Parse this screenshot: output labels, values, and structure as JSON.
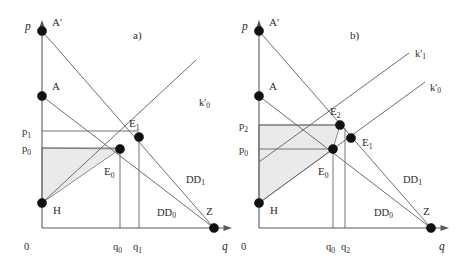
{
  "figure": {
    "panels": [
      {
        "id": "a",
        "label": "a)",
        "axes": {
          "y_label": "p",
          "x_label": "q",
          "origin_label": "0"
        },
        "price_ticks": [
          {
            "name": "p1",
            "label": "p",
            "sub": "1",
            "value_y": 131
          },
          {
            "name": "p0",
            "label": "p",
            "sub": "0",
            "value_y": 148
          }
        ],
        "quantity_ticks": [
          {
            "name": "q0",
            "label": "q",
            "sub": "0",
            "value_x": 120
          },
          {
            "name": "q1",
            "label": "q",
            "sub": "1",
            "value_x": 139
          }
        ],
        "points": [
          {
            "name": "A-prime",
            "label": "A'",
            "x": 42,
            "y": 31
          },
          {
            "name": "A",
            "label": "A",
            "x": 42,
            "y": 96
          },
          {
            "name": "H",
            "label": "H",
            "x": 42,
            "y": 203
          },
          {
            "name": "E1",
            "label": "E",
            "sub": "1",
            "x": 139,
            "y": 137
          },
          {
            "name": "E0",
            "label": "E",
            "sub": "0",
            "x": 120,
            "y": 149
          },
          {
            "name": "Z",
            "label": "Z",
            "x": 214,
            "y": 228
          }
        ],
        "curves": [
          {
            "name": "DD1",
            "label": "DD",
            "sub": "1",
            "from": "A-prime",
            "to": "Z"
          },
          {
            "name": "DD0",
            "label": "DD",
            "sub": "0",
            "from": "A",
            "to": "Z"
          },
          {
            "name": "k-prime-0",
            "label": "k'",
            "sub": "0",
            "from": "H",
            "through": "E0"
          }
        ],
        "shaded_region": {
          "name": "producer-surplus-area",
          "vertices": "H, p0-level, E0",
          "pattern": "horizontal-hatch"
        }
      },
      {
        "id": "b",
        "label": "b)",
        "axes": {
          "y_label": "p",
          "x_label": "q",
          "origin_label": "0"
        },
        "price_ticks": [
          {
            "name": "p2",
            "label": "p",
            "sub": "2",
            "value_y": 125
          },
          {
            "name": "p0",
            "label": "p",
            "sub": "0",
            "value_y": 149
          }
        ],
        "quantity_ticks": [
          {
            "name": "q0",
            "label": "q",
            "sub": "0",
            "value_x": 333
          },
          {
            "name": "q2",
            "label": "q",
            "sub": "2",
            "value_x": 345
          }
        ],
        "points": [
          {
            "name": "A-prime",
            "label": "A'",
            "x": 259,
            "y": 31
          },
          {
            "name": "A",
            "label": "A",
            "x": 259,
            "y": 96
          },
          {
            "name": "H",
            "label": "H",
            "x": 259,
            "y": 203
          },
          {
            "name": "E2",
            "label": "E",
            "sub": "2",
            "x": 340,
            "y": 125
          },
          {
            "name": "E1",
            "label": "E",
            "sub": "1",
            "x": 351,
            "y": 138
          },
          {
            "name": "E0",
            "label": "E",
            "sub": "0",
            "x": 333,
            "y": 149
          },
          {
            "name": "Z",
            "label": "Z",
            "x": 431,
            "y": 228
          }
        ],
        "curves": [
          {
            "name": "DD1",
            "label": "DD",
            "sub": "1",
            "from": "A-prime",
            "to": "Z"
          },
          {
            "name": "DD0",
            "label": "DD",
            "sub": "0",
            "from": "A",
            "to": "Z"
          },
          {
            "name": "k-prime-1",
            "label": "k'",
            "sub": "1",
            "from": "left-of-H",
            "through": "E2"
          },
          {
            "name": "k-prime-0",
            "label": "k'",
            "sub": "0",
            "from": "H",
            "through": "E0"
          }
        ],
        "shaded_region": {
          "name": "producer-surplus-area",
          "vertices": "H, p2-level, E2, p0-level, E0",
          "pattern": "horizontal-hatch"
        }
      }
    ],
    "colors": {
      "line": "#666666",
      "axis": "#5a5a5a",
      "dot": "#111111",
      "hatch": "#d8d8d8",
      "background": "#ffffff"
    }
  }
}
